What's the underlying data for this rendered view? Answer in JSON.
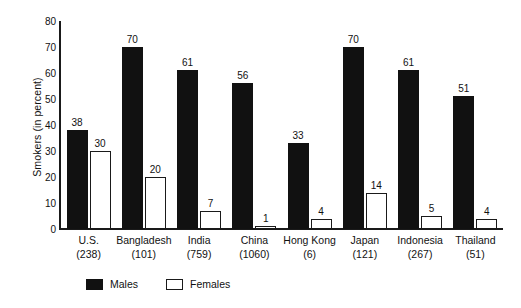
{
  "chart_data": {
    "type": "bar",
    "title": "",
    "xlabel": "",
    "ylabel": "Smokers (in percent)",
    "ylim": [
      0,
      80
    ],
    "yticks": [
      0,
      10,
      20,
      30,
      40,
      50,
      60,
      70,
      80
    ],
    "grid": false,
    "legend_position": "bottom",
    "categories": [
      "U.S.",
      "Bangladesh",
      "India",
      "China",
      "Hong Kong",
      "Japan",
      "Indonesia",
      "Thailand"
    ],
    "category_counts": [
      "(238)",
      "(101)",
      "(759)",
      "(1060)",
      "(6)",
      "(121)",
      "(267)",
      "(51)"
    ],
    "series": [
      {
        "name": "Males",
        "color": "#111111",
        "style": "filled",
        "values": [
          38,
          70,
          61,
          56,
          33,
          70,
          61,
          51
        ]
      },
      {
        "name": "Females",
        "color": "#ffffff",
        "style": "outlined",
        "values": [
          30,
          20,
          7,
          1,
          4,
          14,
          5,
          4
        ]
      }
    ]
  },
  "legend": {
    "items": [
      {
        "label": "Males",
        "swatch": "filled-square-icon"
      },
      {
        "label": "Females",
        "swatch": "open-square-icon"
      }
    ]
  }
}
